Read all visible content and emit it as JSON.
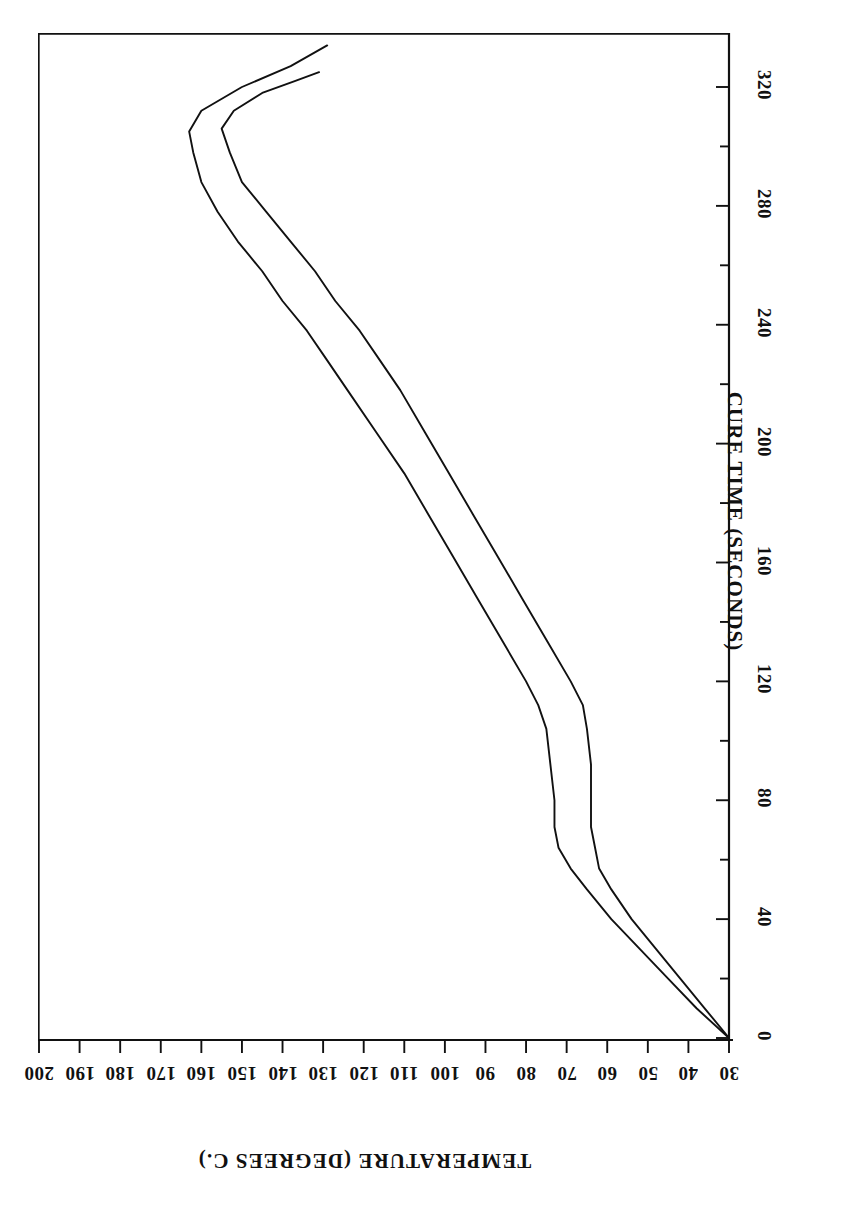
{
  "figure": {
    "background_color": "#ffffff",
    "line_color": "#111111",
    "orientation_note": "chart rendered rotated 90 degrees on the page"
  },
  "chart_data": {
    "type": "line",
    "title": "",
    "subtitle": "",
    "xlabel": "CURE TIME (SECONDS)",
    "ylabel": "TEMPERATURE (DEGREES C.)",
    "xlim": [
      0,
      338
    ],
    "ylim": [
      30,
      200
    ],
    "grid": false,
    "legend": false,
    "legend_position": "none",
    "annotations": [],
    "x_ticks": [
      0,
      40,
      80,
      120,
      160,
      200,
      240,
      280,
      320
    ],
    "x_tick_labels": [
      "0",
      "40",
      "80",
      "120",
      "160",
      "200",
      "240",
      "280",
      "320"
    ],
    "x_minor_ticks": [
      20,
      60,
      100,
      140,
      180,
      220,
      260,
      300
    ],
    "y_ticks": [
      30,
      40,
      50,
      60,
      70,
      80,
      90,
      100,
      110,
      120,
      130,
      140,
      150,
      160,
      170,
      180,
      190,
      200
    ],
    "y_tick_labels": [
      "30",
      "40",
      "50",
      "60",
      "70",
      "80",
      "90",
      "100",
      "110",
      "120",
      "130",
      "140",
      "150",
      "160",
      "170",
      "180",
      "190",
      "200"
    ],
    "series": [
      {
        "name": "upper-curve",
        "x": [
          0,
          10,
          20,
          30,
          40,
          50,
          57,
          64,
          71,
          80,
          92,
          104,
          112,
          120,
          134,
          148,
          162,
          176,
          190,
          204,
          218,
          228,
          238,
          248,
          258,
          268,
          278,
          288,
          298,
          305,
          312,
          320,
          327,
          334
        ],
        "y": [
          30,
          38,
          45,
          52,
          59,
          65,
          69,
          72,
          73,
          73,
          74,
          75,
          77,
          80,
          86,
          92,
          98,
          104,
          110,
          117,
          124,
          129,
          134,
          140,
          145,
          151,
          156,
          160,
          162,
          163,
          160,
          150,
          138,
          129
        ]
      },
      {
        "name": "lower-curve",
        "x": [
          0,
          10,
          20,
          30,
          40,
          50,
          57,
          64,
          71,
          80,
          92,
          104,
          112,
          120,
          134,
          148,
          162,
          176,
          190,
          204,
          218,
          228,
          238,
          248,
          258,
          268,
          278,
          288,
          298,
          306,
          312,
          318,
          322,
          325
        ],
        "y": [
          30,
          36,
          42,
          48,
          54,
          59,
          62,
          63,
          64,
          64,
          64,
          65,
          66,
          69,
          75,
          81,
          87,
          93,
          99,
          105,
          111,
          116,
          121,
          127,
          132,
          138,
          144,
          150,
          153,
          155,
          152,
          145,
          137,
          131
        ]
      }
    ]
  },
  "axis_titles": {
    "x": "CURE TIME (SECONDS)",
    "y": "TEMPERATURE (DEGREES C.)"
  }
}
